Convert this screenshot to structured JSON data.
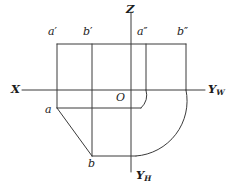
{
  "figure": {
    "type": "engineering-projection-drawing",
    "stroke_color": "#3a3a3a",
    "background_color": "#ffffff"
  },
  "axes": [
    {
      "id": "x-axis",
      "label": "X",
      "sub": "",
      "label_x": 11,
      "label_y": 84
    },
    {
      "id": "yw-axis",
      "label": "Y",
      "sub": "W",
      "label_x": 208,
      "label_y": 84
    },
    {
      "id": "yh-axis",
      "label": "Y",
      "sub": "H",
      "label_x": 136,
      "label_y": 170
    },
    {
      "id": "z-axis",
      "label": "Z",
      "sub": "",
      "label_x": 126,
      "label_y": 4
    }
  ],
  "origin": {
    "label": "O",
    "x": 116,
    "y": 92
  },
  "points": [
    {
      "id": "a-front",
      "label": "a",
      "prime": "′",
      "x": 48,
      "y": 26
    },
    {
      "id": "b-front",
      "label": "b",
      "prime": "′",
      "x": 83,
      "y": 26
    },
    {
      "id": "a-side",
      "label": "a",
      "prime": "″",
      "x": 137,
      "y": 26
    },
    {
      "id": "b-side",
      "label": "b",
      "prime": "″",
      "x": 177,
      "y": 26
    },
    {
      "id": "a-top",
      "label": "a",
      "prime": "",
      "x": 45,
      "y": 104
    },
    {
      "id": "b-top",
      "label": "b",
      "prime": "",
      "x": 88,
      "y": 158
    }
  ],
  "geometry": {
    "x_axis_line": {
      "x1": 22,
      "y1": 90,
      "x2": 205,
      "y2": 90
    },
    "z_axis_line": {
      "x1": 131,
      "y1": 12,
      "x2": 131,
      "y2": 172
    },
    "top_edge": {
      "x1": 57,
      "y1": 44,
      "x2": 186,
      "y2": 44
    },
    "verticals": [
      {
        "x": 57,
        "y1": 44,
        "y2": 108
      },
      {
        "x": 92,
        "y1": 44,
        "y2": 156
      },
      {
        "x": 146,
        "y1": 44,
        "y2": 90
      },
      {
        "x": 186,
        "y1": 44,
        "y2": 90
      }
    ],
    "top_view_edge": {
      "x1": 57,
      "y1": 108,
      "x2": 141,
      "y2": 108
    },
    "bottom_edge": {
      "x1": 92,
      "y1": 156,
      "x2": 136,
      "y2": 156
    },
    "diagonal": {
      "x1": 57,
      "y1": 108,
      "x2": 92,
      "y2": 156
    },
    "small_arc": {
      "cx": 131,
      "cy": 90,
      "r": 18,
      "note": "quarter arc from vertical at x=146 to horizontal at y=108"
    },
    "large_arc": {
      "cx": 131,
      "cy": 90,
      "r": 55,
      "note": "quarter arc from vertical at x=186 to horizontal at y=156"
    }
  }
}
